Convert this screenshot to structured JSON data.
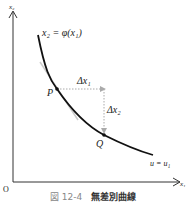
{
  "figure": {
    "number_label": "図 12-4",
    "title": "無差別曲線"
  },
  "axes": {
    "origin_label": "O",
    "x_label": "x₁",
    "y_label": "x₂"
  },
  "curve": {
    "equation_label": "x₂ = φ(x₁)",
    "level_label": "u = u₁"
  },
  "points": {
    "P": "P",
    "Q": "Q"
  },
  "deltas": {
    "dx1": "Δx₁",
    "dx2": "Δx₂"
  },
  "colors": {
    "curve": "#111111",
    "axis": "#333333",
    "dotted": "#aaaaaa",
    "tangent": "#cccccc"
  }
}
